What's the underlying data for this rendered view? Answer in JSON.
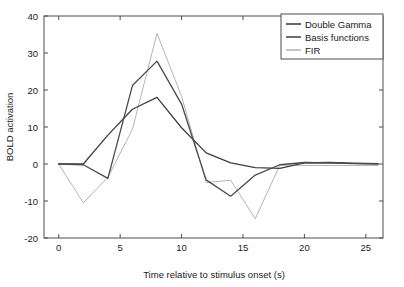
{
  "chart_data": {
    "type": "line",
    "title": "",
    "xlabel": "Time relative to stimulus onset (s)",
    "ylabel": "BOLD activation",
    "xlim": [
      -1.2,
      26.4
    ],
    "ylim": [
      -20,
      40
    ],
    "xticks": [
      0,
      5,
      10,
      15,
      20,
      25
    ],
    "xtick_labels": [
      "0",
      "5",
      "10",
      "15",
      "20",
      "25"
    ],
    "yticks": [
      -20,
      -10,
      0,
      10,
      20,
      30,
      40
    ],
    "ytick_labels": [
      "-20",
      "-10",
      "0",
      "10",
      "20",
      "30",
      "40"
    ],
    "grid": false,
    "legend_position": "top-right",
    "x": [
      0,
      2,
      4,
      6,
      8,
      10,
      12,
      14,
      16,
      18,
      20,
      22,
      24,
      26
    ],
    "series": [
      {
        "name": "Double Gamma",
        "color": "#3f3f3f",
        "values": [
          0,
          0,
          7.8,
          14.8,
          18.0,
          9.8,
          3.0,
          0.3,
          -1.0,
          -1.2,
          0.3,
          0.4,
          0.2,
          0.1
        ]
      },
      {
        "name": "Basis functions",
        "color": "#4a4a4a",
        "values": [
          0,
          -0.2,
          -3.9,
          21.2,
          27.8,
          16.2,
          -4.3,
          -8.7,
          -3.0,
          -0.2,
          0.4,
          0.3,
          0.1,
          0.0
        ]
      },
      {
        "name": "FIR",
        "color": "#b5b5b5",
        "values": [
          0,
          -10.5,
          -3.6,
          9.4,
          35.3,
          18.3,
          -5.0,
          -4.4,
          -14.8,
          -0.3,
          -0.4,
          -0.4,
          -0.4,
          -0.4
        ]
      }
    ]
  },
  "legend": {
    "entries": [
      {
        "label": "Double Gamma"
      },
      {
        "label": "Basis functions"
      },
      {
        "label": "FIR"
      }
    ]
  },
  "axes": {
    "x_title": "Time relative to stimulus onset (s)",
    "y_title": "BOLD activation"
  }
}
